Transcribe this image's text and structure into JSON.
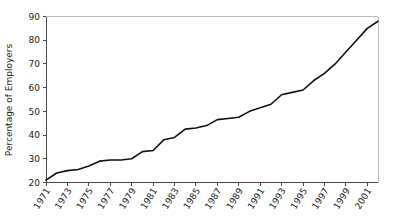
{
  "chart_data": {
    "type": "line",
    "title": "",
    "xlabel": "",
    "ylabel": "Percentage of Employers",
    "xlim": [
      1971,
      2002
    ],
    "ylim": [
      20,
      90
    ],
    "grid": false,
    "legend": null,
    "x_tick_labels": [
      "1971",
      "1973",
      "1975",
      "1977",
      "1979",
      "1981",
      "1983",
      "1985",
      "1987",
      "1989",
      "1991",
      "1993",
      "1995",
      "1997",
      "1999",
      "2001"
    ],
    "x_tick_values": [
      1971,
      1973,
      1975,
      1977,
      1979,
      1981,
      1983,
      1985,
      1987,
      1989,
      1991,
      1993,
      1995,
      1997,
      1999,
      2001
    ],
    "y_tick_labels": [
      "20",
      "30",
      "40",
      "50",
      "60",
      "70",
      "80",
      "90"
    ],
    "y_tick_values": [
      20,
      30,
      40,
      50,
      60,
      70,
      80,
      90
    ],
    "x": [
      1971,
      1972,
      1973,
      1974,
      1975,
      1976,
      1977,
      1978,
      1979,
      1980,
      1981,
      1982,
      1983,
      1984,
      1985,
      1986,
      1987,
      1988,
      1989,
      1990,
      1991,
      1992,
      1993,
      1994,
      1995,
      1996,
      1997,
      1998,
      1999,
      2000,
      2001,
      2002
    ],
    "values": [
      21,
      24,
      25,
      25.5,
      27,
      29,
      29.5,
      29.5,
      30,
      33,
      33.5,
      38,
      39,
      42.5,
      43,
      44,
      46.5,
      47,
      47.5,
      50,
      51.5,
      53,
      57,
      58,
      59,
      63,
      66,
      70,
      75,
      80,
      85,
      88
    ],
    "series": [
      {
        "name": "Percentage of Employers",
        "color": "#111111",
        "values": [
          21,
          24,
          25,
          25.5,
          27,
          29,
          29.5,
          29.5,
          30,
          33,
          33.5,
          38,
          39,
          42.5,
          43,
          44,
          46.5,
          47,
          47.5,
          50,
          51.5,
          53,
          57,
          58,
          59,
          63,
          66,
          70,
          75,
          80,
          85,
          88
        ]
      }
    ]
  }
}
